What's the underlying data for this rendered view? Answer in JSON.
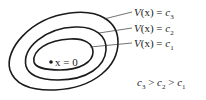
{
  "diagram": {
    "origin_label": "x = 0",
    "level_sets": [
      {
        "id": "c1",
        "label_prefix": "V",
        "label_arg": "(x)",
        "label_eq": " = ",
        "label_var": "c",
        "label_sub": "1"
      },
      {
        "id": "c2",
        "label_prefix": "V",
        "label_arg": "(x)",
        "label_eq": " = ",
        "label_var": "c",
        "label_sub": "2"
      },
      {
        "id": "c3",
        "label_prefix": "V",
        "label_arg": "(x)",
        "label_eq": " = ",
        "label_var": "c",
        "label_sub": "3"
      }
    ],
    "inequality": {
      "terms": [
        {
          "var": "c",
          "sub": "3"
        },
        {
          "op": " > "
        },
        {
          "var": "c",
          "sub": "2"
        },
        {
          "op": " > "
        },
        {
          "var": "c",
          "sub": "1"
        }
      ]
    },
    "colors": {
      "stroke": "#1a1a1a",
      "text": "#222222",
      "background": "#ffffff"
    }
  }
}
